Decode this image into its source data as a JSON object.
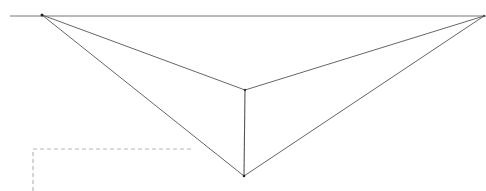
{
  "diagram": {
    "type": "two-point perspective sketch",
    "background": "#ffffff",
    "stroke_color": "#555555",
    "horizon_color": "#777777",
    "dashed_color": "#b8b8b8",
    "horizon": {
      "x1": 10,
      "y1": 16,
      "x2": 486,
      "y2": 16
    },
    "vanishing_points": {
      "left": {
        "x": 42,
        "y": 15
      },
      "right": {
        "x": 484,
        "y": 16
      }
    },
    "vertical_edge": {
      "top": {
        "x": 245,
        "y": 90
      },
      "bottom": {
        "x": 244,
        "y": 176
      }
    },
    "dashed_region": {
      "x": 33,
      "y": 149,
      "right_x": 194,
      "bottom_y": 191
    }
  }
}
